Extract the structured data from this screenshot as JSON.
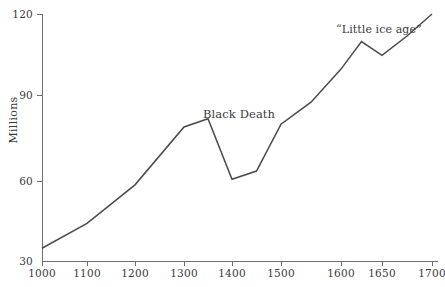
{
  "chart_data": {
    "type": "line",
    "title": "",
    "subtitle": "",
    "xlabel": "",
    "ylabel": "Millions",
    "xlim": [
      1000,
      1700
    ],
    "ylim": [
      30,
      120
    ],
    "grid": false,
    "legend": "none",
    "x_ticks": [
      {
        "label": "1000",
        "value": 1000
      },
      {
        "label": "1100",
        "value": 1100
      },
      {
        "label": "1200",
        "value": 1200
      },
      {
        "label": "1300",
        "value": 1300
      },
      {
        "label": "1400",
        "value": 1400
      },
      {
        "label": "1500",
        "value": 1500
      },
      {
        "label": "1600",
        "value": 1600
      },
      {
        "label": "1650",
        "value": 1650
      },
      {
        "label": "1700",
        "value": 1700
      }
    ],
    "y_ticks": [
      {
        "label": "120",
        "value": 120
      },
      {
        "label": "90",
        "value": 90
      },
      {
        "label": "60",
        "value": 60
      },
      {
        "label": "30",
        "value": 30
      }
    ],
    "x": [
      1000,
      1100,
      1200,
      1300,
      1350,
      1400,
      1450,
      1500,
      1550,
      1600,
      1625,
      1650,
      1675,
      1700
    ],
    "values": [
      35,
      44,
      58,
      79,
      82,
      60,
      63,
      80,
      88,
      100,
      110,
      105,
      112,
      120
    ],
    "series": [
      {
        "name": "European population",
        "x": [
          1000,
          1100,
          1200,
          1300,
          1350,
          1400,
          1450,
          1500,
          1550,
          1600,
          1625,
          1650,
          1675,
          1700
        ],
        "values": [
          35,
          44,
          58,
          79,
          82,
          60,
          63,
          80,
          88,
          100,
          110,
          105,
          112,
          120
        ],
        "color": "#4a4a4c"
      }
    ],
    "annotations": [
      {
        "text": "Black Death",
        "x": 1350,
        "y": 86
      },
      {
        "text": "“Little ice age”",
        "x": 1625,
        "y": 115
      }
    ]
  },
  "axes": {
    "y_title": "Millions",
    "y_labels": [
      "120",
      "90",
      "60",
      "30"
    ],
    "x_labels": [
      "1000",
      "1100",
      "1200",
      "1300",
      "1400",
      "1500",
      "1600",
      "1650",
      "1700"
    ]
  },
  "annotations": {
    "black_death": "Black Death",
    "little_ice_age": "“Little ice age”"
  },
  "colors": {
    "line": "#4a4a4c",
    "axis": "#6f6f70",
    "text": "#3b3b3c",
    "background": "#ffffff"
  }
}
